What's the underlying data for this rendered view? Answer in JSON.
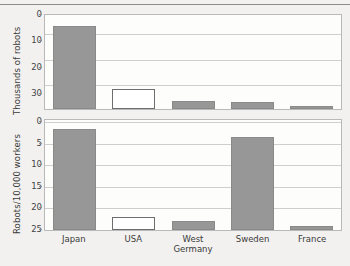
{
  "chart_data": [
    {
      "type": "bar",
      "panel": "top",
      "title": "",
      "xlabel": "",
      "ylabel": "Thousands of robots",
      "categories": [
        "Japan",
        "USA",
        "West Germany",
        "Sweden",
        "France"
      ],
      "values": [
        31.0,
        7.5,
        3.0,
        2.5,
        1.2
      ],
      "yticks": [
        0,
        10,
        20,
        30
      ],
      "ylim": [
        0,
        36
      ],
      "grid": true,
      "legend": "none",
      "series_styles": [
        "filled",
        "hollow",
        "filled",
        "filled",
        "filled"
      ]
    },
    {
      "type": "bar",
      "panel": "bottom",
      "title": "",
      "xlabel": "",
      "ylabel": "Robots/10,000 workers",
      "categories": [
        "Japan",
        "USA",
        "West Germany",
        "Sweden",
        "France"
      ],
      "values": [
        23.5,
        3.0,
        2.0,
        21.5,
        1.0
      ],
      "yticks": [
        0,
        5,
        10,
        15,
        20,
        25
      ],
      "ylim": [
        0,
        25.8
      ],
      "grid": true,
      "legend": "none",
      "series_styles": [
        "filled",
        "hollow",
        "filled",
        "filled",
        "filled"
      ]
    }
  ],
  "axes": {
    "top": {
      "ylabel": "Thousands of robots",
      "tick_labels": [
        "0",
        "10",
        "20",
        "30"
      ]
    },
    "bottom": {
      "ylabel": "Robots/10,000 workers",
      "tick_labels": [
        "0",
        "5",
        "10",
        "15",
        "20",
        "25"
      ]
    }
  },
  "xaxis": {
    "labels": [
      {
        "line1": "Japan",
        "line2": ""
      },
      {
        "line1": "USA",
        "line2": ""
      },
      {
        "line1": "West",
        "line2": "Germany"
      },
      {
        "line1": "Sweden",
        "line2": ""
      },
      {
        "line1": "France",
        "line2": ""
      }
    ]
  },
  "colors": {
    "bar_fill": "#979797",
    "bar_hollow": "#ffffff",
    "bar_stroke": "#6e6e6e",
    "grid": "#cfcfcf",
    "plot_bg": "#fdfdfc",
    "page_bg": "#f2f1ef",
    "text": "#3a3a3a"
  }
}
